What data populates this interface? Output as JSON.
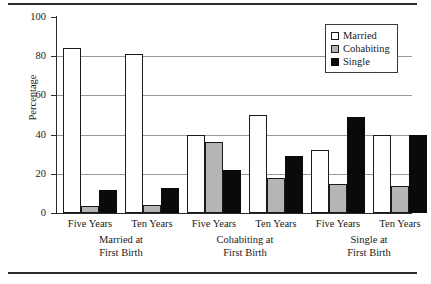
{
  "chart_data": {
    "type": "bar",
    "title": "",
    "xlabel": "",
    "ylabel": "Percentage",
    "ylim": [
      0,
      100
    ],
    "ytick_values": [
      0,
      20,
      40,
      60,
      80,
      100
    ],
    "ytick_labels": [
      "0",
      "20",
      "40",
      "60",
      "80",
      "100"
    ],
    "grid": "horizontal",
    "legend_position": "top-right",
    "categories": [
      "Five Years",
      "Ten Years",
      "Five Years",
      "Ten Years",
      "Five Years",
      "Ten Years"
    ],
    "panels": [
      {
        "label_line1": "Married at",
        "label_line2": "First Birth",
        "groups": [
          0,
          1
        ]
      },
      {
        "label_line1": "Cohabiting at",
        "label_line2": "First Birth",
        "groups": [
          2,
          3
        ]
      },
      {
        "label_line1": "Single at",
        "label_line2": "First Birth",
        "groups": [
          4,
          5
        ]
      }
    ],
    "series": [
      {
        "name": "Married",
        "color": "#ffffff",
        "values": [
          84,
          81,
          40,
          50,
          32,
          40
        ]
      },
      {
        "name": "Cohabiting",
        "color": "#b5b5b5",
        "values": [
          3.5,
          4,
          36,
          18,
          15,
          14
        ]
      },
      {
        "name": "Single",
        "color": "#0a0a0a",
        "values": [
          11.5,
          13,
          22,
          29,
          49,
          40
        ]
      }
    ]
  },
  "legend": {
    "items": [
      {
        "label": "Married"
      },
      {
        "label": "Cohabiting"
      },
      {
        "label": "Single"
      }
    ]
  }
}
